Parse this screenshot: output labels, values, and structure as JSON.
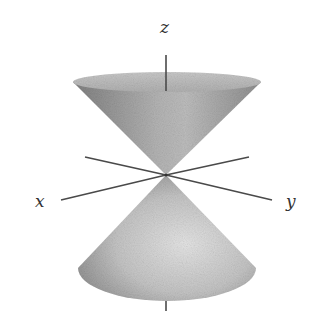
{
  "figure": {
    "labels": {
      "z": "z",
      "x": "x",
      "y": "y"
    },
    "colors": {
      "background": "#ffffff",
      "axis": "#4a4a4a",
      "cone_dark": "#7a7a7a",
      "cone_mid": "#a8a8a8",
      "cone_light": "#d6d6d6",
      "label": "#333333"
    }
  }
}
